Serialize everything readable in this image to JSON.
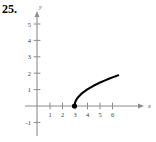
{
  "figure": {
    "problem_number": "25.",
    "caption": ""
  },
  "chart_data": {
    "type": "line",
    "title": "",
    "xlabel": "x",
    "ylabel": "y",
    "xlim": [
      -0.6,
      7.2
    ],
    "ylim": [
      -1.6,
      5.8
    ],
    "grid": false,
    "legend": null,
    "x_ticks": [
      1,
      2,
      3,
      4,
      5,
      6
    ],
    "x_tick_labels": [
      "1",
      "2",
      "3",
      "4",
      "5",
      "6"
    ],
    "y_ticks": [
      -1,
      1,
      2,
      3,
      4,
      5
    ],
    "y_tick_labels": [
      "-1",
      "1",
      "2",
      "3",
      "4",
      "5"
    ],
    "function": "y = sqrt(x - 3)",
    "domain_start": 3,
    "domain_end": 6.5,
    "endpoint_marker": "closed-dot",
    "endpoint": [
      3,
      0
    ],
    "series": [
      {
        "name": "y = sqrt(x - 3)",
        "color": "#000000",
        "x": [
          3.0,
          3.05,
          3.1,
          3.2,
          3.3,
          3.5,
          3.7,
          4.0,
          4.3,
          4.6,
          5.0,
          5.4,
          5.8,
          6.1,
          6.5
        ],
        "values": [
          0.0,
          0.224,
          0.316,
          0.447,
          0.548,
          0.707,
          0.837,
          1.0,
          1.14,
          1.265,
          1.414,
          1.549,
          1.673,
          1.761,
          1.871
        ]
      }
    ],
    "axis_color": "#8c8c8c",
    "curve_color": "#000000"
  },
  "colors": {
    "background": "#ffffff",
    "axis": "#8c8c8c",
    "curve": "#000000",
    "text": "#000000"
  }
}
